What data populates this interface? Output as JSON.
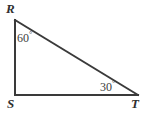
{
  "figure": {
    "type": "right-triangle-diagram",
    "background_color": "#ffffff",
    "stroke_color": "#3a3a3a",
    "stroke_width": 2,
    "width": 147,
    "height": 116,
    "vertices": [
      {
        "name": "R",
        "label": "R",
        "x": 15,
        "y": 20
      },
      {
        "name": "S",
        "label": "S",
        "x": 15,
        "y": 95
      },
      {
        "name": "T",
        "label": "T",
        "x": 138,
        "y": 95
      }
    ],
    "edges": [
      {
        "name": "RS",
        "from": "R",
        "to": "S"
      },
      {
        "name": "ST",
        "from": "S",
        "to": "T"
      },
      {
        "name": "RT",
        "from": "R",
        "to": "T"
      }
    ],
    "angles": [
      {
        "at": "R",
        "value": "60",
        "degree_symbol": "°",
        "text": "60°"
      },
      {
        "at": "T",
        "value": "30",
        "degree_symbol": "°",
        "text": "30°"
      },
      {
        "at": "S",
        "value": "90",
        "degree_symbol": "°",
        "text": "90°",
        "shown": false
      }
    ],
    "labels": {
      "vertex_R": "R",
      "vertex_S": "S",
      "vertex_T": "T",
      "angle_R_value": "60",
      "angle_R_degree": "°",
      "angle_T_value": "30",
      "angle_T_degree": "°"
    }
  }
}
